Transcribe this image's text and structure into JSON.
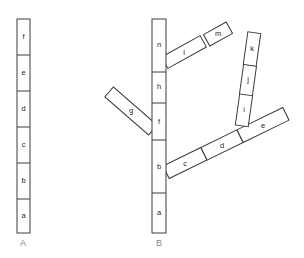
{
  "figure": {
    "type": "diagram",
    "background_color": "#ffffff",
    "stroke_color": "#3c3c3c",
    "fill_color": "#ffffff",
    "label_color": "#1d1d1d",
    "panel_label_color": "#8a8a8a"
  },
  "panels": [
    {
      "id": "A",
      "label": "A",
      "label_x": 23,
      "label_y": 244,
      "kind": "linear-stack",
      "segments": [
        {
          "label": "f",
          "x": 17,
          "y": 19,
          "w": 13,
          "h": 36,
          "cx": 23.5,
          "cy": 37
        },
        {
          "label": "e",
          "x": 17,
          "y": 55,
          "w": 13,
          "h": 36,
          "cx": 23.5,
          "cy": 73
        },
        {
          "label": "d",
          "x": 17,
          "y": 91,
          "w": 13,
          "h": 36,
          "cx": 23.5,
          "cy": 109
        },
        {
          "label": "c",
          "x": 17,
          "y": 127,
          "w": 13,
          "h": 36,
          "cx": 23.5,
          "cy": 145
        },
        {
          "label": "b",
          "x": 17,
          "y": 163,
          "w": 13,
          "h": 36,
          "cx": 23.5,
          "cy": 181
        },
        {
          "label": "a",
          "x": 17,
          "y": 199,
          "w": 13,
          "h": 34,
          "cx": 23.5,
          "cy": 216
        }
      ]
    },
    {
      "id": "B",
      "label": "B",
      "label_x": 159,
      "label_y": 244,
      "kind": "branching-tree",
      "trunk": {
        "x": 152,
        "y": 19,
        "w": 14,
        "h": 214,
        "segments": [
          {
            "label": "n",
            "y0": 19,
            "y1": 72,
            "cx": 159,
            "cy": 45
          },
          {
            "label": "h",
            "y0": 72,
            "y1": 103,
            "cx": 159,
            "cy": 87
          },
          {
            "label": "f",
            "y0": 103,
            "y1": 140,
            "cx": 159,
            "cy": 122
          },
          {
            "label": "b",
            "y0": 140,
            "y1": 193,
            "cx": 159,
            "cy": 167
          },
          {
            "label": "a",
            "y0": 193,
            "y1": 233,
            "cx": 159,
            "cy": 213
          }
        ]
      },
      "branches": [
        {
          "name": "branch-lm",
          "attach": "trunk-n-h",
          "segments": [
            {
              "label": "l",
              "cx": 184,
              "cy": 52,
              "angle": -29,
              "w": 44,
              "h": 13
            },
            {
              "label": "m",
              "cx": 218,
              "cy": 34,
              "angle": -29,
              "w": 26,
              "h": 13
            }
          ]
        },
        {
          "name": "branch-g",
          "attach": "trunk-f",
          "segments": [
            {
              "label": "g",
              "cx": 131,
              "cy": 111,
              "angle": 41,
              "w": 58,
              "h": 13
            }
          ]
        },
        {
          "name": "branch-cde",
          "attach": "trunk-b",
          "segments": [
            {
              "label": "c",
              "cx": 185,
              "cy": 163,
              "angle": -26,
              "w": 42,
              "h": 14
            },
            {
              "label": "d",
              "cx": 222,
              "cy": 145,
              "angle": -26,
              "w": 40,
              "h": 14
            },
            {
              "label": "e",
              "cx": 263,
              "cy": 125,
              "angle": -26,
              "w": 51,
              "h": 14
            }
          ]
        },
        {
          "name": "branch-ijk",
          "attach": "branch-e",
          "segments": [
            {
              "label": "i",
              "cx": 244,
              "cy": 110,
              "angle": 8,
              "w": 13,
              "h": 32
            },
            {
              "label": "j",
              "cx": 248,
              "cy": 80,
              "angle": 8,
              "w": 13,
              "h": 30
            },
            {
              "label": "k",
              "cx": 252,
              "cy": 49,
              "angle": 8,
              "w": 13,
              "h": 33
            }
          ]
        }
      ]
    }
  ]
}
